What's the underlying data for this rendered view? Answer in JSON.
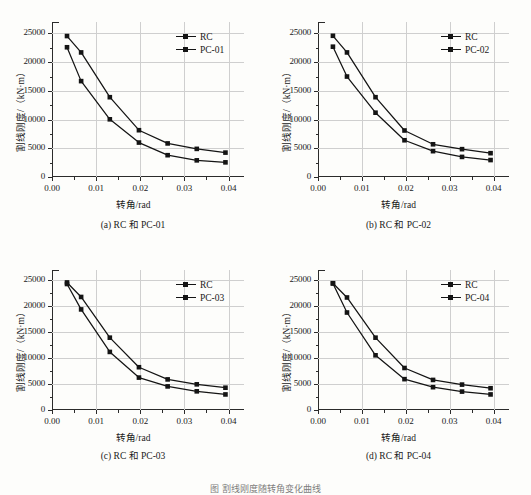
{
  "figure": {
    "caption": "图  割线刚度随转角变化曲线"
  },
  "axes": {
    "xlabel": "转角/rad",
    "ylabel": "割线刚度/（kN·m）",
    "xticks": [
      "0.00",
      "0.01",
      "0.02",
      "0.03",
      "0.04"
    ],
    "yticks": [
      "0",
      "5000",
      "10000",
      "15000",
      "20000",
      "25000"
    ]
  },
  "chart_data": [
    {
      "type": "line",
      "panel": "a",
      "title": "(a) RC 和 PC-01",
      "xlabel": "转角/rad",
      "ylabel": "割线刚度/（kN·m）",
      "xlim": [
        0.0,
        0.0435
      ],
      "ylim": [
        0,
        27000
      ],
      "xticks": [
        0.0,
        0.01,
        0.02,
        0.03,
        0.04
      ],
      "xticklabels": [
        "0.00",
        "0.01",
        "0.02",
        "0.03",
        "0.04"
      ],
      "yticks": [
        0,
        5000,
        10000,
        15000,
        20000,
        25000
      ],
      "yticklabels": [
        "0",
        "5000",
        "10000",
        "15000",
        "20000",
        "25000"
      ],
      "grid": true,
      "legend_position": "upper right",
      "x": [
        0.0034,
        0.0066,
        0.0131,
        0.0197,
        0.0262,
        0.0328,
        0.0393
      ],
      "series": [
        {
          "name": "RC",
          "values": [
            24550,
            21700,
            13900,
            8150,
            5850,
            4900,
            4250
          ]
        },
        {
          "name": "PC-01",
          "values": [
            22600,
            16700,
            10050,
            6000,
            3800,
            2900,
            2550
          ]
        }
      ]
    },
    {
      "type": "line",
      "panel": "b",
      "title": "(b) RC 和 PC-02",
      "xlabel": "转角/rad",
      "ylabel": "割线刚度/（kN·m）",
      "xlim": [
        0.0,
        0.0435
      ],
      "ylim": [
        0,
        27000
      ],
      "xticks": [
        0.0,
        0.01,
        0.02,
        0.03,
        0.04
      ],
      "xticklabels": [
        "0.00",
        "0.01",
        "0.02",
        "0.03",
        "0.04"
      ],
      "yticks": [
        0,
        5000,
        10000,
        15000,
        20000,
        25000
      ],
      "yticklabels": [
        "0",
        "5000",
        "10000",
        "15000",
        "20000",
        "25000"
      ],
      "grid": true,
      "legend_position": "upper right",
      "x": [
        0.0034,
        0.0066,
        0.0131,
        0.0197,
        0.0262,
        0.0328,
        0.0393
      ],
      "series": [
        {
          "name": "RC",
          "values": [
            24600,
            21700,
            13900,
            8100,
            5700,
            4850,
            4150
          ]
        },
        {
          "name": "PC-02",
          "values": [
            22700,
            17500,
            11200,
            6400,
            4500,
            3500,
            2950
          ]
        }
      ]
    },
    {
      "type": "line",
      "panel": "c",
      "title": "(c) RC 和 PC-03",
      "xlabel": "转角/rad",
      "ylabel": "割线刚度/（kN·m）",
      "xlim": [
        0.0,
        0.0435
      ],
      "ylim": [
        0,
        27000
      ],
      "xticks": [
        0.0,
        0.01,
        0.02,
        0.03,
        0.04
      ],
      "xticklabels": [
        "0.00",
        "0.01",
        "0.02",
        "0.03",
        "0.04"
      ],
      "yticks": [
        0,
        5000,
        10000,
        15000,
        20000,
        25000
      ],
      "yticklabels": [
        "0",
        "5000",
        "10000",
        "15000",
        "20000",
        "25000"
      ],
      "grid": true,
      "legend_position": "upper right",
      "x": [
        0.0034,
        0.0066,
        0.0131,
        0.0197,
        0.0262,
        0.0328,
        0.0393
      ],
      "series": [
        {
          "name": "RC",
          "values": [
            24600,
            21800,
            13950,
            8250,
            5900,
            4950,
            4300
          ]
        },
        {
          "name": "PC-03",
          "values": [
            24300,
            19400,
            11200,
            6250,
            4550,
            3600,
            3000
          ]
        }
      ]
    },
    {
      "type": "line",
      "panel": "d",
      "title": "(d) RC 和 PC-04",
      "xlabel": "转角/rad",
      "ylabel": "割线刚度/（kN·m）",
      "xlim": [
        0.0,
        0.0435
      ],
      "ylim": [
        0,
        27000
      ],
      "xticks": [
        0.0,
        0.01,
        0.02,
        0.03,
        0.04
      ],
      "xticklabels": [
        "0.00",
        "0.01",
        "0.02",
        "0.03",
        "0.04"
      ],
      "yticks": [
        0,
        5000,
        10000,
        15000,
        20000,
        25000
      ],
      "yticklabels": [
        "0",
        "5000",
        "10000",
        "15000",
        "20000",
        "25000"
      ],
      "grid": true,
      "legend_position": "upper right",
      "x": [
        0.0034,
        0.0066,
        0.0131,
        0.0197,
        0.0262,
        0.0328,
        0.0393
      ],
      "series": [
        {
          "name": "RC",
          "values": [
            24450,
            21700,
            13950,
            8100,
            5800,
            4900,
            4200
          ]
        },
        {
          "name": "PC-04",
          "values": [
            24400,
            18800,
            10550,
            5950,
            4400,
            3550,
            3000
          ]
        }
      ]
    }
  ]
}
